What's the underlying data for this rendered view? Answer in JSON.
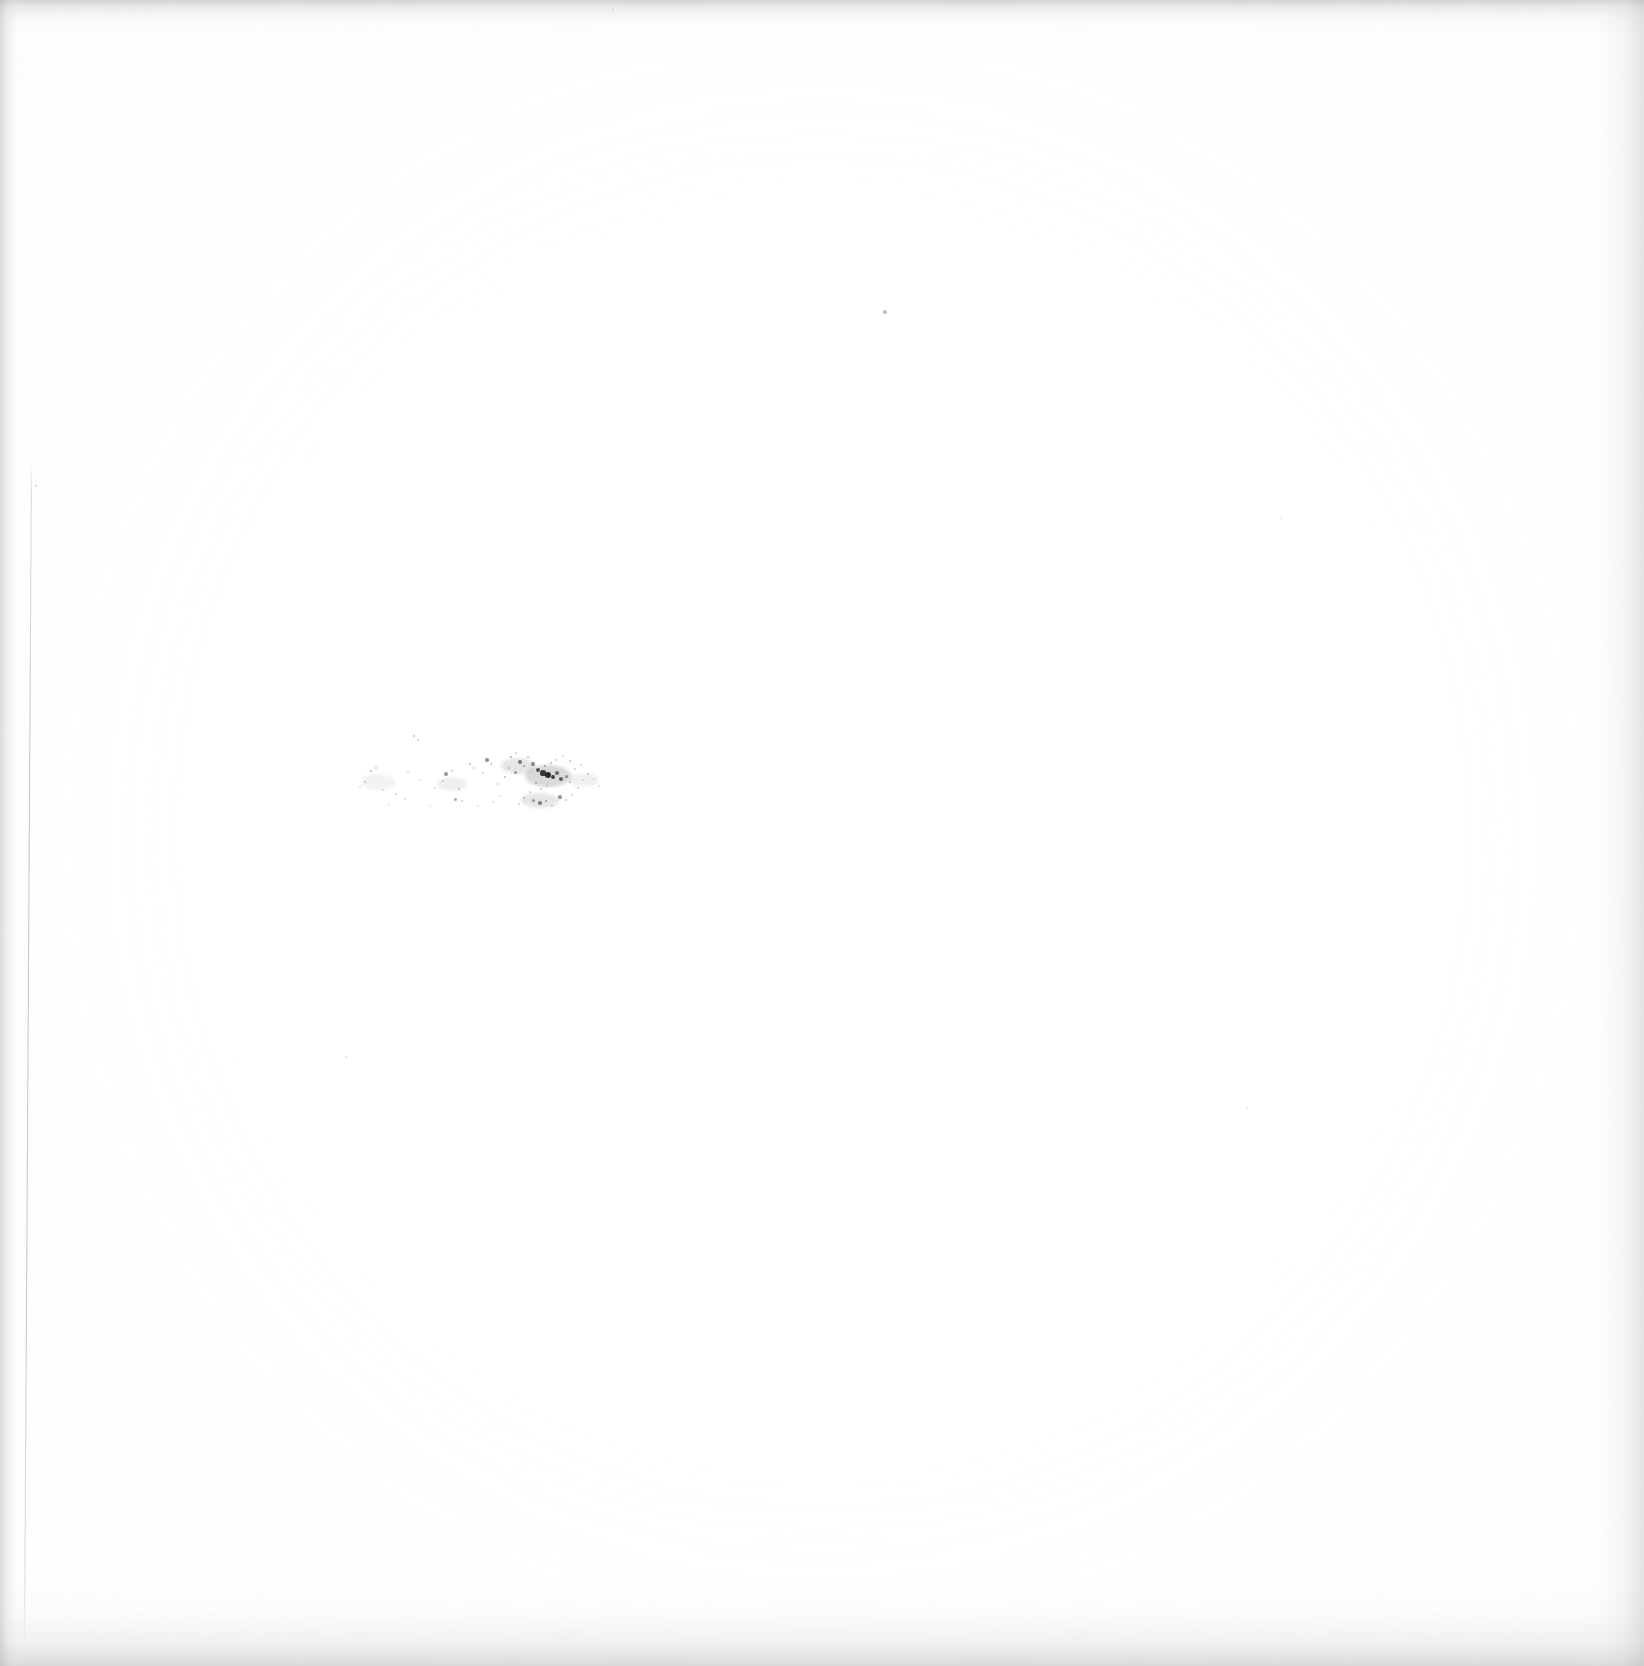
{
  "document": {
    "kind": "scanned-page",
    "title": "",
    "body_text": "",
    "visible_text": "",
    "page_number": "",
    "note": "Page is blank apart from a faint vertical margin rule and a band of residual ink specks; no legible characters are rendered in the pixels."
  },
  "canvas": {
    "width": 1644,
    "height": 1666,
    "paper_color": "#ffffff",
    "ink_color": "#1b1b1b",
    "edge_shadow_color": "#b0b0b2"
  },
  "margin_rule": {
    "label": "",
    "x_top": 31,
    "x_bottom": 24,
    "y_start": 460,
    "y_end": 1645,
    "color": "#aaaab0"
  },
  "speck_band": {
    "label": "",
    "x_min": 352,
    "x_max": 604,
    "y_min": 732,
    "y_max": 808,
    "densest_center_x": 548,
    "densest_center_y": 776,
    "specks": [
      {
        "x": 414,
        "y": 736,
        "r": 1.3,
        "o": 0.3
      },
      {
        "x": 418,
        "y": 740,
        "r": 1.0,
        "o": 0.22
      },
      {
        "x": 371,
        "y": 771,
        "r": 1.4,
        "o": 0.34
      },
      {
        "x": 376,
        "y": 768,
        "r": 1.1,
        "o": 0.26
      },
      {
        "x": 365,
        "y": 782,
        "r": 1.2,
        "o": 0.24
      },
      {
        "x": 360,
        "y": 787,
        "r": 1.0,
        "o": 0.18
      },
      {
        "x": 383,
        "y": 790,
        "r": 1.0,
        "o": 0.16
      },
      {
        "x": 396,
        "y": 794,
        "r": 1.2,
        "o": 0.2
      },
      {
        "x": 405,
        "y": 799,
        "r": 1.0,
        "o": 0.15
      },
      {
        "x": 389,
        "y": 805,
        "r": 1.0,
        "o": 0.14
      },
      {
        "x": 435,
        "y": 788,
        "r": 0.9,
        "o": 0.13
      },
      {
        "x": 446,
        "y": 774,
        "r": 1.6,
        "o": 0.42
      },
      {
        "x": 452,
        "y": 771,
        "r": 1.1,
        "o": 0.26
      },
      {
        "x": 443,
        "y": 781,
        "r": 1.0,
        "o": 0.2
      },
      {
        "x": 459,
        "y": 789,
        "r": 1.2,
        "o": 0.24
      },
      {
        "x": 455,
        "y": 799,
        "r": 1.5,
        "o": 0.38
      },
      {
        "x": 462,
        "y": 801,
        "r": 1.1,
        "o": 0.24
      },
      {
        "x": 470,
        "y": 764,
        "r": 1.2,
        "o": 0.26
      },
      {
        "x": 474,
        "y": 768,
        "r": 0.9,
        "o": 0.18
      },
      {
        "x": 487,
        "y": 760,
        "r": 1.7,
        "o": 0.46
      },
      {
        "x": 491,
        "y": 764,
        "r": 1.1,
        "o": 0.25
      },
      {
        "x": 483,
        "y": 773,
        "r": 1.0,
        "o": 0.19
      },
      {
        "x": 498,
        "y": 784,
        "r": 1.0,
        "o": 0.17
      },
      {
        "x": 505,
        "y": 777,
        "r": 1.3,
        "o": 0.28
      },
      {
        "x": 511,
        "y": 757,
        "r": 1.4,
        "o": 0.33
      },
      {
        "x": 516,
        "y": 753,
        "r": 1.1,
        "o": 0.24
      },
      {
        "x": 520,
        "y": 762,
        "r": 1.8,
        "o": 0.52
      },
      {
        "x": 524,
        "y": 766,
        "r": 1.3,
        "o": 0.34
      },
      {
        "x": 515,
        "y": 772,
        "r": 1.5,
        "o": 0.4
      },
      {
        "x": 509,
        "y": 768,
        "r": 1.1,
        "o": 0.26
      },
      {
        "x": 528,
        "y": 757,
        "r": 1.2,
        "o": 0.28
      },
      {
        "x": 533,
        "y": 764,
        "r": 1.6,
        "o": 0.44
      },
      {
        "x": 538,
        "y": 770,
        "r": 2.2,
        "o": 0.7
      },
      {
        "x": 543,
        "y": 773,
        "r": 2.6,
        "o": 0.84
      },
      {
        "x": 548,
        "y": 775,
        "r": 3.0,
        "o": 0.92
      },
      {
        "x": 553,
        "y": 777,
        "r": 2.4,
        "o": 0.8
      },
      {
        "x": 557,
        "y": 773,
        "r": 1.9,
        "o": 0.6
      },
      {
        "x": 561,
        "y": 779,
        "r": 2.1,
        "o": 0.66
      },
      {
        "x": 566,
        "y": 776,
        "r": 1.5,
        "o": 0.42
      },
      {
        "x": 570,
        "y": 782,
        "r": 1.3,
        "o": 0.32
      },
      {
        "x": 545,
        "y": 766,
        "r": 1.4,
        "o": 0.36
      },
      {
        "x": 551,
        "y": 763,
        "r": 1.2,
        "o": 0.28
      },
      {
        "x": 556,
        "y": 760,
        "r": 1.0,
        "o": 0.2
      },
      {
        "x": 536,
        "y": 783,
        "r": 1.4,
        "o": 0.36
      },
      {
        "x": 541,
        "y": 789,
        "r": 1.2,
        "o": 0.28
      },
      {
        "x": 547,
        "y": 786,
        "r": 1.0,
        "o": 0.22
      },
      {
        "x": 530,
        "y": 792,
        "r": 1.1,
        "o": 0.22
      },
      {
        "x": 524,
        "y": 798,
        "r": 1.3,
        "o": 0.3
      },
      {
        "x": 519,
        "y": 804,
        "r": 1.1,
        "o": 0.22
      },
      {
        "x": 533,
        "y": 800,
        "r": 1.5,
        "o": 0.4
      },
      {
        "x": 540,
        "y": 803,
        "r": 1.8,
        "o": 0.52
      },
      {
        "x": 546,
        "y": 801,
        "r": 1.4,
        "o": 0.34
      },
      {
        "x": 552,
        "y": 806,
        "r": 1.2,
        "o": 0.26
      },
      {
        "x": 560,
        "y": 797,
        "r": 1.6,
        "o": 0.44
      },
      {
        "x": 566,
        "y": 800,
        "r": 1.2,
        "o": 0.26
      },
      {
        "x": 572,
        "y": 795,
        "r": 1.0,
        "o": 0.18
      },
      {
        "x": 578,
        "y": 788,
        "r": 1.1,
        "o": 0.2
      },
      {
        "x": 583,
        "y": 780,
        "r": 1.0,
        "o": 0.17
      },
      {
        "x": 588,
        "y": 774,
        "r": 1.2,
        "o": 0.24
      },
      {
        "x": 594,
        "y": 779,
        "r": 1.0,
        "o": 0.16
      },
      {
        "x": 599,
        "y": 786,
        "r": 0.9,
        "o": 0.13
      },
      {
        "x": 575,
        "y": 769,
        "r": 1.1,
        "o": 0.22
      },
      {
        "x": 581,
        "y": 765,
        "r": 1.0,
        "o": 0.18
      },
      {
        "x": 570,
        "y": 761,
        "r": 1.2,
        "o": 0.26
      },
      {
        "x": 563,
        "y": 756,
        "r": 1.0,
        "o": 0.18
      },
      {
        "x": 500,
        "y": 796,
        "r": 1.0,
        "o": 0.16
      },
      {
        "x": 493,
        "y": 802,
        "r": 1.1,
        "o": 0.18
      },
      {
        "x": 478,
        "y": 806,
        "r": 0.9,
        "o": 0.13
      },
      {
        "x": 430,
        "y": 806,
        "r": 0.9,
        "o": 0.12
      },
      {
        "x": 420,
        "y": 780,
        "r": 0.9,
        "o": 0.13
      },
      {
        "x": 408,
        "y": 772,
        "r": 1.0,
        "o": 0.16
      }
    ],
    "smudges": [
      {
        "x": 548,
        "y": 776,
        "w": 46,
        "h": 22,
        "o": 0.16
      },
      {
        "x": 518,
        "y": 766,
        "w": 34,
        "h": 16,
        "o": 0.1
      },
      {
        "x": 540,
        "y": 800,
        "w": 38,
        "h": 15,
        "o": 0.1
      },
      {
        "x": 452,
        "y": 784,
        "w": 30,
        "h": 14,
        "o": 0.07
      },
      {
        "x": 378,
        "y": 782,
        "w": 34,
        "h": 16,
        "o": 0.05
      },
      {
        "x": 584,
        "y": 780,
        "w": 30,
        "h": 14,
        "o": 0.06
      }
    ]
  },
  "isolated_marks": [
    {
      "name": "speck-upper-right",
      "x": 885,
      "y": 312,
      "r": 1.6,
      "o": 0.26
    },
    {
      "name": "speck-mid-left",
      "x": 346,
      "y": 1057,
      "r": 1.3,
      "o": 0.14
    },
    {
      "name": "speck-rule-top",
      "x": 36,
      "y": 486,
      "r": 1.2,
      "o": 0.18
    },
    {
      "name": "speck-upper-left",
      "x": 613,
      "y": 10,
      "r": 1.1,
      "o": 0.12
    },
    {
      "name": "speck-right-edge",
      "x": 1281,
      "y": 518,
      "r": 1.2,
      "o": 0.1
    },
    {
      "name": "speck-right-low",
      "x": 1247,
      "y": 1108,
      "r": 1.1,
      "o": 0.1
    }
  ]
}
